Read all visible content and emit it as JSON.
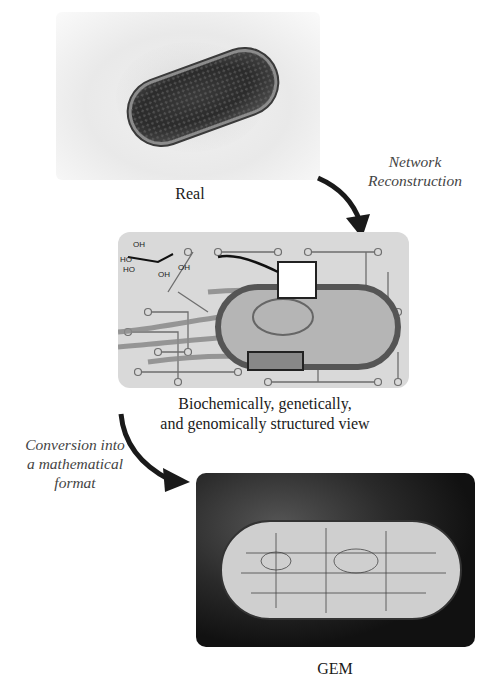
{
  "stages": {
    "real": {
      "caption": "Real"
    },
    "network": {
      "caption_line1": "Biochemically, genetically,",
      "caption_line2": "and genomically structured view"
    },
    "gem": {
      "caption": "GEM"
    }
  },
  "transitions": {
    "network_reconstruction": {
      "line1": "Network",
      "line2": "Reconstruction"
    },
    "conversion": {
      "line1": "Conversion into",
      "line2": "a mathematical",
      "line3": "format"
    }
  },
  "molecule_labels": [
    "OH",
    "HO",
    "HO",
    "OH",
    "OH"
  ],
  "colors": {
    "panel_bg": "#d9d9d9",
    "network_line": "#6e6e6e",
    "arrow": "#1a1a1a"
  }
}
